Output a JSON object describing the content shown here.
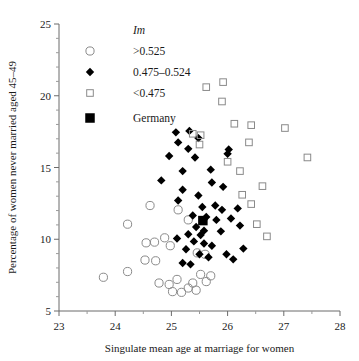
{
  "chart_data": {
    "type": "scatter",
    "title": "",
    "xlabel": "Singulate mean age at marriage for women",
    "ylabel": "Percentage of women never married aged 45–49",
    "xlim": [
      23,
      28
    ],
    "ylim": [
      5,
      25
    ],
    "xticks": [
      23,
      24,
      25,
      26,
      27,
      28
    ],
    "yticks": [
      5,
      10,
      15,
      20,
      25
    ],
    "xminor_step": 0.5,
    "yminor_step": 1,
    "grid": false,
    "legend": {
      "position": "top-left-inside",
      "title": "Im",
      "entries": [
        {
          "label": ">0.525",
          "marker": "open-circle"
        },
        {
          "label": "0.475–0.524",
          "marker": "filled-diamond"
        },
        {
          "label": "<0.475",
          "marker": "open-square"
        },
        {
          "label": "Germany",
          "marker": "filled-square"
        }
      ]
    },
    "series": [
      {
        "name": ">0.525",
        "marker": "open-circle",
        "points": [
          [
            23.79,
            7.35
          ],
          [
            24.22,
            11.05
          ],
          [
            24.55,
            9.75
          ],
          [
            24.7,
            9.8
          ],
          [
            24.53,
            8.55
          ],
          [
            24.72,
            8.5
          ],
          [
            24.22,
            7.75
          ],
          [
            24.88,
            10.1
          ],
          [
            24.98,
            9.55
          ],
          [
            24.78,
            6.95
          ],
          [
            24.96,
            6.85
          ],
          [
            25.1,
            7.2
          ],
          [
            25.02,
            6.35
          ],
          [
            25.18,
            6.3
          ],
          [
            25.3,
            6.6
          ],
          [
            25.38,
            6.95
          ],
          [
            25.44,
            6.45
          ],
          [
            25.3,
            11.35
          ],
          [
            25.12,
            12.05
          ],
          [
            25.52,
            7.55
          ],
          [
            24.62,
            12.35
          ],
          [
            25.62,
            7.05
          ],
          [
            25.7,
            7.45
          ],
          [
            25.46,
            9.05
          ],
          [
            25.6,
            8.95
          ]
        ]
      },
      {
        "name": "0.475–0.524",
        "marker": "filled-diamond",
        "points": [
          [
            25.08,
            17.45
          ],
          [
            25.12,
            16.75
          ],
          [
            25.32,
            17.55
          ],
          [
            25.48,
            17.05
          ],
          [
            25.3,
            16.3
          ],
          [
            24.96,
            15.8
          ],
          [
            25.42,
            15.7
          ],
          [
            25.2,
            14.75
          ],
          [
            25.7,
            14.85
          ],
          [
            24.82,
            14.1
          ],
          [
            25.72,
            13.95
          ],
          [
            25.2,
            13.45
          ],
          [
            25.48,
            13.05
          ],
          [
            25.12,
            12.7
          ],
          [
            25.55,
            12.25
          ],
          [
            25.78,
            12.35
          ],
          [
            25.9,
            12.05
          ],
          [
            25.38,
            11.65
          ],
          [
            25.62,
            11.55
          ],
          [
            25.8,
            11.35
          ],
          [
            25.44,
            10.85
          ],
          [
            25.58,
            10.6
          ],
          [
            25.3,
            10.35
          ],
          [
            25.52,
            10.3
          ],
          [
            25.88,
            10.55
          ],
          [
            25.1,
            10.05
          ],
          [
            25.4,
            9.85
          ],
          [
            25.58,
            9.7
          ],
          [
            25.72,
            9.55
          ],
          [
            25.26,
            9.3
          ],
          [
            25.5,
            8.95
          ],
          [
            25.66,
            8.75
          ],
          [
            25.98,
            8.95
          ],
          [
            25.2,
            8.35
          ],
          [
            25.34,
            8.25
          ],
          [
            26.1,
            8.6
          ],
          [
            26.28,
            9.35
          ],
          [
            26.22,
            10.95
          ],
          [
            26.06,
            11.45
          ],
          [
            26.18,
            12.15
          ],
          [
            25.92,
            13.65
          ],
          [
            26.0,
            15.95
          ],
          [
            26.02,
            16.25
          ]
        ]
      },
      {
        "name": "<0.475",
        "marker": "open-square",
        "points": [
          [
            25.62,
            20.6
          ],
          [
            25.9,
            19.6
          ],
          [
            25.92,
            20.95
          ],
          [
            25.38,
            17.35
          ],
          [
            25.52,
            17.25
          ],
          [
            25.5,
            16.6
          ],
          [
            26.12,
            18.05
          ],
          [
            26.42,
            17.95
          ],
          [
            27.02,
            17.75
          ],
          [
            26.38,
            16.75
          ],
          [
            26.0,
            15.4
          ],
          [
            26.22,
            14.75
          ],
          [
            26.26,
            13.1
          ],
          [
            26.42,
            12.45
          ],
          [
            26.62,
            13.7
          ],
          [
            27.42,
            15.7
          ],
          [
            26.52,
            11.05
          ],
          [
            26.7,
            10.2
          ]
        ]
      },
      {
        "name": "Germany",
        "marker": "filled-square",
        "points": [
          [
            25.56,
            11.3
          ]
        ]
      }
    ]
  }
}
